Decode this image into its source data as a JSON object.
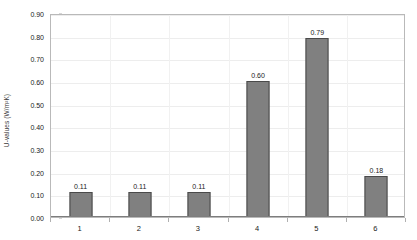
{
  "chart_data": {
    "type": "bar",
    "title": "",
    "xlabel": "",
    "ylabel": "U-values (W/m²K)",
    "categories": [
      "1",
      "2",
      "3",
      "4",
      "5",
      "6"
    ],
    "values": [
      0.11,
      0.11,
      0.11,
      0.6,
      0.79,
      0.18
    ],
    "data_labels": [
      "0.11",
      "0.11",
      "0.11",
      "0.60",
      "0.79",
      "0.18"
    ],
    "ylim": [
      0.0,
      0.9
    ],
    "ytick_step": 0.1,
    "ytick_labels": [
      "0.90",
      "0.80",
      "0.70",
      "0.60",
      "0.50",
      "0.40",
      "0.30",
      "0.20",
      "0.10",
      "0.00"
    ],
    "ytick_values": [
      0.9,
      0.8,
      0.7,
      0.6,
      0.5,
      0.4,
      0.3,
      0.2,
      0.1,
      0.0
    ],
    "grid": true,
    "legend": null,
    "series_color": "#808080",
    "series_border_color": "#4a4a4a",
    "gridline_color": "#ededed",
    "axis_color": "#b9b9b9",
    "title_fragment": ""
  }
}
